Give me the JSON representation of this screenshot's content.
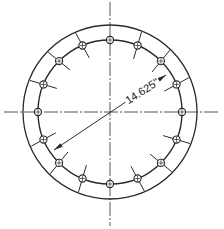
{
  "diagram": {
    "type": "bolt-circle-flange-drawing",
    "dimension_label": "14.625\"",
    "center": [
      110,
      112
    ],
    "outer_radius": 87,
    "bolt_circle_radius": 72,
    "hole_count": 16,
    "hole_radius": 3.6,
    "tick_inner_radius": 58,
    "tick_outer_radius": 86,
    "tick_offset_deg": 6,
    "line_color": "#2a2a2a",
    "centerline_color": "#555555",
    "dimension_line": {
      "from": [
        54,
        150
      ],
      "to": [
        166,
        75
      ]
    },
    "label_angle_deg": -33
  }
}
